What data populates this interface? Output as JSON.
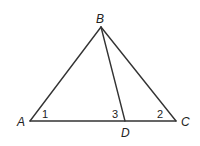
{
  "diagram": {
    "type": "triangle",
    "vertices": {
      "A": {
        "label": "A"
      },
      "B": {
        "label": "B"
      },
      "C": {
        "label": "C"
      },
      "D": {
        "label": "D"
      }
    },
    "segments": [
      "AB",
      "BC",
      "AC",
      "BD"
    ],
    "angles": [
      {
        "label": "1",
        "at": "A"
      },
      {
        "label": "3",
        "at": "D"
      },
      {
        "label": "2",
        "at": "C"
      }
    ],
    "line_color": "#333333"
  }
}
